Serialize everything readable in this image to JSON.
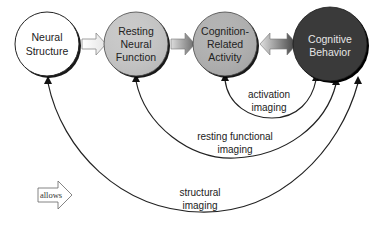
{
  "nodes": [
    {
      "id": "neural-structure",
      "lines": [
        "Neural",
        "Structure"
      ],
      "fill": "#ffffff",
      "text_color": "#222222"
    },
    {
      "id": "resting-neural-function",
      "lines": [
        "Resting",
        "Neural",
        "Function"
      ],
      "fill": "#c9c9c9",
      "text_color": "#222222"
    },
    {
      "id": "cognition-related-activity",
      "lines": [
        "Cognition-",
        "Related",
        "Activity"
      ],
      "fill": "#b3b3b3",
      "text_color": "#222222"
    },
    {
      "id": "cognitive-behavior",
      "lines": [
        "Cognitive",
        "Behavior"
      ],
      "fill": "#3a3a3a",
      "text_color": "#e6e6e6"
    }
  ],
  "edges": [
    {
      "id": "activation-imaging",
      "lines": [
        "activation",
        "imaging"
      ]
    },
    {
      "id": "resting-functional-imaging",
      "lines": [
        "resting functional",
        "imaging"
      ]
    },
    {
      "id": "structural-imaging",
      "lines": [
        "structural",
        "imaging"
      ]
    }
  ],
  "legend": {
    "label": "allows"
  }
}
